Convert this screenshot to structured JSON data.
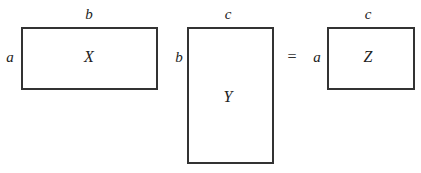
{
  "equation": {
    "operator": "=",
    "matrices": [
      {
        "name": "X",
        "row_label": "a",
        "col_label": "b"
      },
      {
        "name": "Y",
        "row_label": "b",
        "col_label": "c"
      },
      {
        "name": "Z",
        "row_label": "a",
        "col_label": "c"
      }
    ]
  }
}
